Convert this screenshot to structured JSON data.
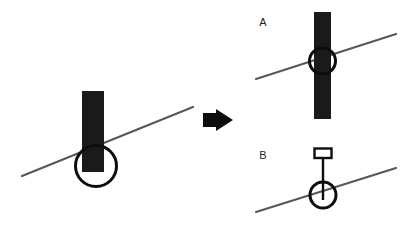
{
  "figure": {
    "title": "",
    "background_color": "#ffffff",
    "width": 404,
    "height": 230,
    "ink_color": "#1a1a1a",
    "line_color": "#58585a",
    "panels": [
      {
        "id": "before",
        "label": "",
        "description": "thick black vertical bar resting on a diagonal line with an open circle marking the contact point"
      },
      {
        "id": "after-a",
        "label": "A",
        "description": "thick black vertical bar crossing through the diagonal line with an open circle at the crossing point"
      },
      {
        "id": "after-b",
        "label": "B",
        "description": "thin vertical stem with a small open rectangle at the top, ending in an open circle on the diagonal line"
      }
    ],
    "arrow": {
      "label": "",
      "direction": "right",
      "semantic": "transforms-into"
    }
  },
  "labels": {
    "panel_a": "A",
    "panel_b": "B"
  }
}
